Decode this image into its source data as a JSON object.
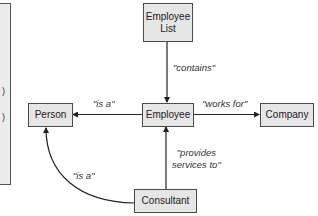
{
  "side_panel": {
    "glyphs": [
      ")",
      ")"
    ]
  },
  "nodes": {
    "employee_list": {
      "line1": "Employee",
      "line2": "List"
    },
    "person": {
      "label": "Person"
    },
    "employee": {
      "label": "Employee"
    },
    "company": {
      "label": "Company"
    },
    "consultant": {
      "label": "Consultant"
    }
  },
  "edges": {
    "contains": {
      "label": "\"contains\"",
      "from": "Employee List",
      "to": "Employee"
    },
    "is_a_employee": {
      "label": "\"is a\"",
      "from": "Employee",
      "to": "Person"
    },
    "works_for": {
      "label": "\"works for\"",
      "from": "Employee",
      "to": "Company"
    },
    "provides_services": {
      "line1": "\"provides",
      "line2": "services to\"",
      "from": "Consultant",
      "to": "Employee"
    },
    "is_a_consultant": {
      "label": "\"is a\"",
      "from": "Consultant",
      "to": "Person"
    }
  },
  "colors": {
    "node_fill": "#e6e6e6",
    "node_border": "#4a4a4a",
    "edge": "#222222"
  }
}
